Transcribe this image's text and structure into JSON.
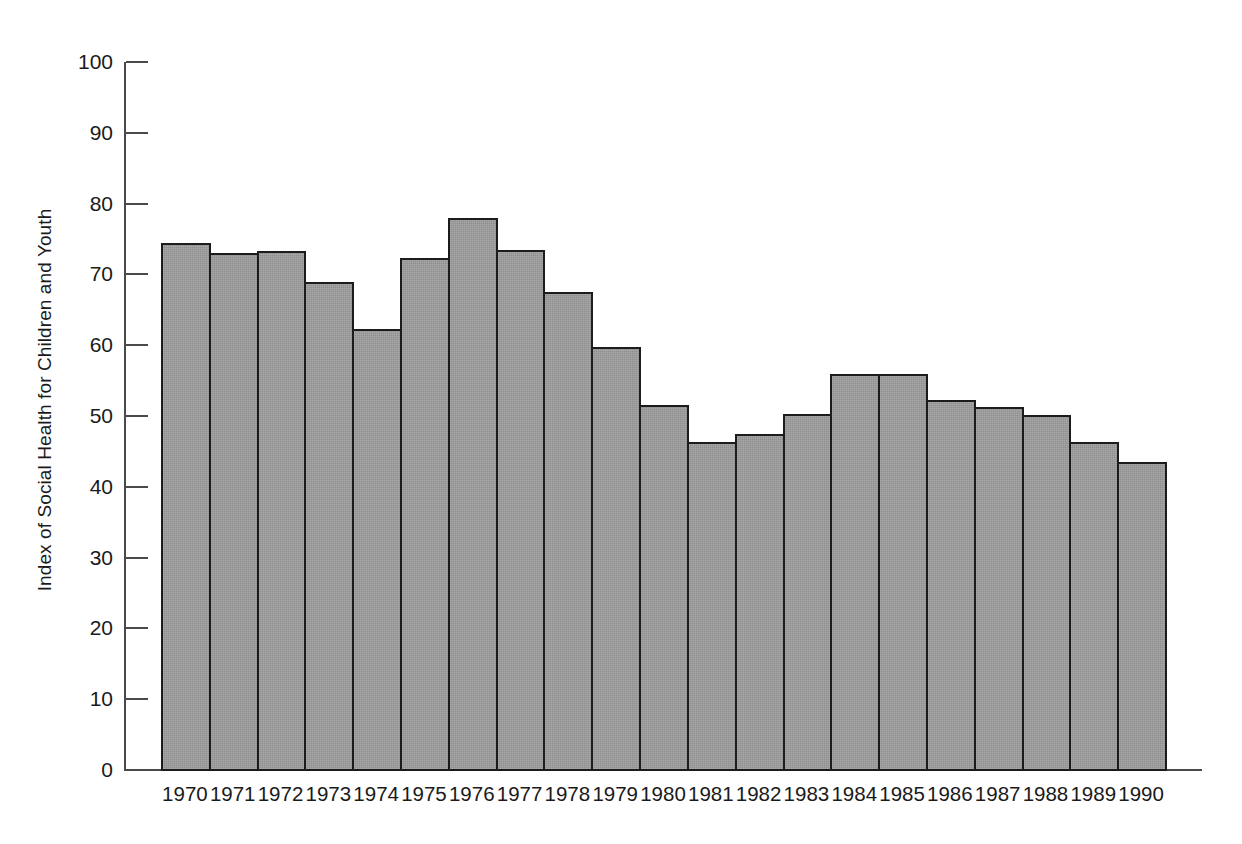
{
  "chart_data": {
    "type": "bar",
    "title": "",
    "xlabel": "",
    "ylabel": "Index of Social Health for Children and Youth",
    "ylim": [
      0,
      100
    ],
    "ytick_labels": [
      "100",
      "90",
      "80",
      "70",
      "60",
      "50",
      "40",
      "30",
      "20",
      "10",
      "0"
    ],
    "yticks": [
      100,
      90,
      80,
      70,
      60,
      50,
      40,
      30,
      20,
      10,
      0
    ],
    "grid": false,
    "legend": null,
    "bar_color": "#9e9e9e",
    "bar_edge_color": "#1c1c1c",
    "axis_color": "#4a4a4a",
    "categories": [
      "1970",
      "1971",
      "1972",
      "1973",
      "1974",
      "1975",
      "1976",
      "1977",
      "1978",
      "1979",
      "1980",
      "1981",
      "1982",
      "1983",
      "1984",
      "1985",
      "1986",
      "1987",
      "1988",
      "1989",
      "1990"
    ],
    "values": [
      74.5,
      73.0,
      73.3,
      68.9,
      62.3,
      72.3,
      78.0,
      73.4,
      67.5,
      59.8,
      51.5,
      46.3,
      47.4,
      50.3,
      56.0,
      56.0,
      52.3,
      51.3,
      50.1,
      46.4,
      43.5
    ]
  }
}
